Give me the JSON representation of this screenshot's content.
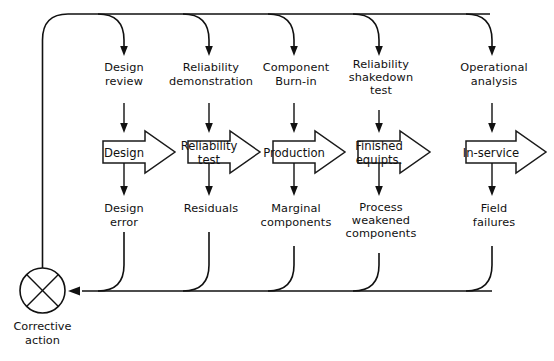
{
  "diagram": {
    "background_color": "#ffffff",
    "line_color": "#111111",
    "summing_junction": {
      "label_line1": "Corrective",
      "label_line2": "action",
      "symbol": "crossed-circle"
    },
    "stages": [
      {
        "id": "design",
        "input_line1": "Design",
        "input_line2": "review",
        "block_line1": "Design",
        "block_line2": "",
        "output_line1": "Design",
        "output_line2": "error"
      },
      {
        "id": "reliability-test",
        "input_line1": "Reliability",
        "input_line2": "demonstration",
        "block_line1": "Reliability",
        "block_line2": "test",
        "output_line1": "Residuals",
        "output_line2": ""
      },
      {
        "id": "production",
        "input_line1": "Component",
        "input_line2": "Burn-in",
        "block_line1": "Production",
        "block_line2": "",
        "output_line1": "Marginal",
        "output_line2": "components"
      },
      {
        "id": "finished-equipts",
        "input_line1": "Reliability",
        "input_line2": "shakedown",
        "input_line3": "test",
        "block_line1": "Finished",
        "block_line2": "equipts.",
        "output_line1": "Process",
        "output_line2": "weakened",
        "output_line3": "components"
      },
      {
        "id": "in-service",
        "input_line1": "Operational",
        "input_line2": "analysis",
        "block_line1": "In-service",
        "block_line2": "",
        "output_line1": "Field",
        "output_line2": "failures"
      }
    ]
  }
}
